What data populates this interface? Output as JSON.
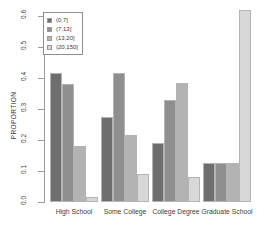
{
  "chart_data": {
    "type": "bar",
    "title": "",
    "subtitle": "",
    "xlabel": "",
    "ylabel": "PROPORTION",
    "categories": [
      "High School",
      "Some College",
      "College Degree",
      "Graduate School"
    ],
    "series": [
      {
        "name": "(0,7]",
        "color": "#6e6e6e",
        "values": [
          0.415,
          0.275,
          0.19,
          0.125
        ]
      },
      {
        "name": "(7,13]",
        "color": "#8f8f8f",
        "values": [
          0.38,
          0.415,
          0.33,
          0.125
        ]
      },
      {
        "name": "(13,20]",
        "color": "#b3b3b3",
        "values": [
          0.18,
          0.215,
          0.385,
          0.125
        ]
      },
      {
        "name": "(20,150]",
        "color": "#d8d8d8",
        "values": [
          0.015,
          0.09,
          0.08,
          0.62
        ]
      }
    ],
    "ylim": [
      0.0,
      0.63
    ],
    "yticks": [
      0.0,
      0.1,
      0.2,
      0.3,
      0.4,
      0.5,
      0.6
    ],
    "ytick_labels": [
      "0.0",
      "0.1",
      "0.2",
      "0.3",
      "0.4",
      "0.5",
      "0.6"
    ],
    "grid": false,
    "legend_position": "top-left",
    "legend_title": ""
  },
  "axis": {
    "line_color": "#9a9a9a"
  }
}
